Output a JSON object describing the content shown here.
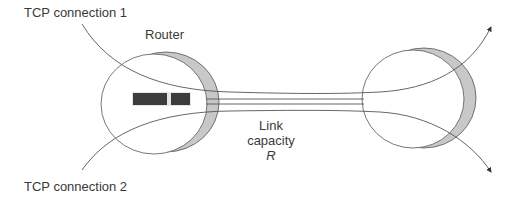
{
  "diagram": {
    "labels": {
      "tcp1": "TCP connection 1",
      "tcp2": "TCP connection 2",
      "router": "Router",
      "link_line1": "Link",
      "link_line2": "capacity",
      "link_symbol": "R"
    },
    "nodes": [
      {
        "id": "router-left",
        "label": "Router"
      },
      {
        "id": "router-right",
        "label": ""
      }
    ],
    "edges": [
      {
        "from": "TCP connection 1",
        "via": [
          "router-left",
          "router-right"
        ],
        "to": "upper-right"
      },
      {
        "from": "TCP connection 2",
        "via": [
          "router-left",
          "router-right"
        ],
        "to": "lower-right"
      }
    ],
    "colors": {
      "stroke": "#555555",
      "shade": "#c8c8c8",
      "buffer": "#3c3c3c",
      "text": "#3a3a3a"
    }
  }
}
